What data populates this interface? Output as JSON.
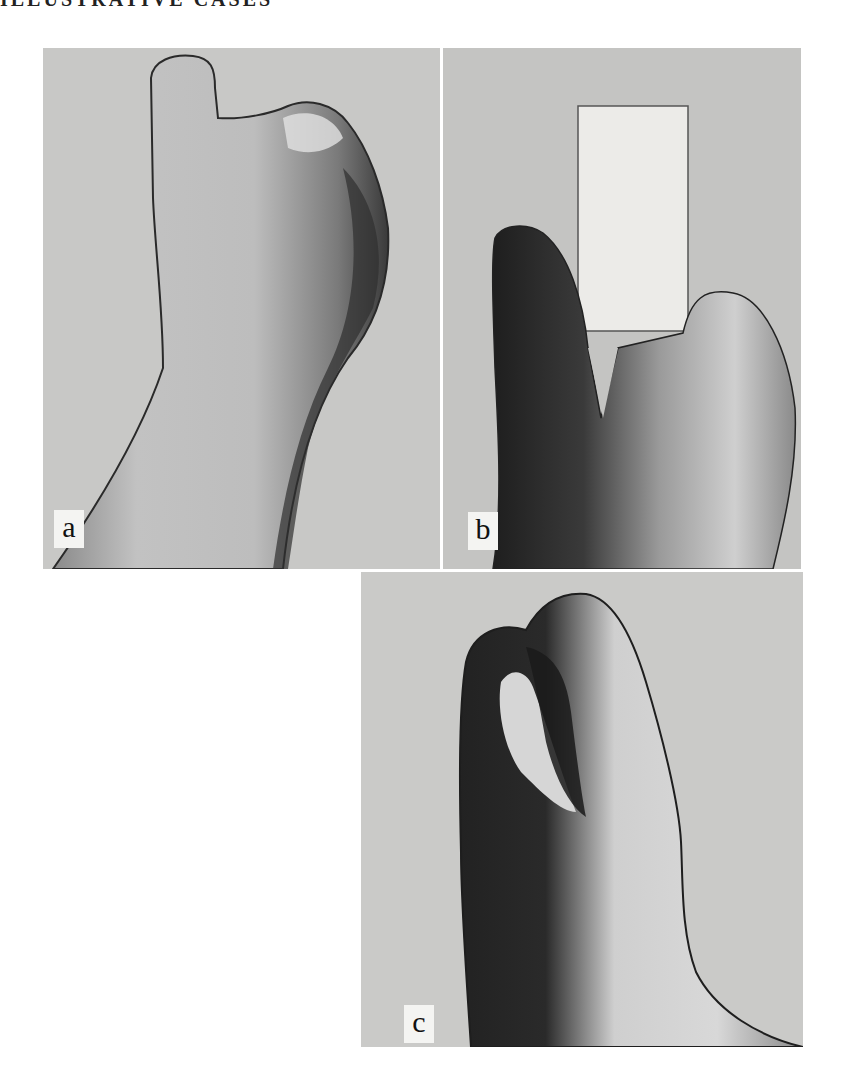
{
  "page": {
    "running_header": "ILLUSTRATIVE CASES"
  },
  "figure": {
    "panels": [
      {
        "id": "a",
        "label": "a",
        "subject": "hand with two remaining digit stumps, dorsal view"
      },
      {
        "id": "b",
        "label": "b",
        "subject": "hand grasping a roll of adhesive tape between two digits"
      },
      {
        "id": "c",
        "label": "c",
        "subject": "hand with cleft between two digits, lateral view"
      }
    ]
  },
  "colors": {
    "page_background": "#ffffff",
    "photo_background": "#c9c9c9",
    "label_background": "#f4f4f2",
    "label_text": "#111111"
  }
}
